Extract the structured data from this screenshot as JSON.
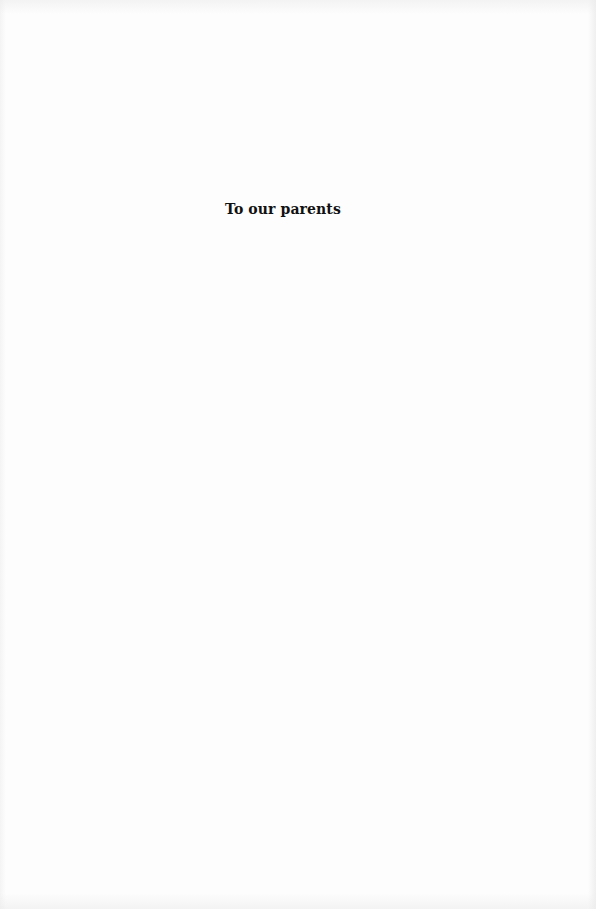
{
  "page": {
    "type": "dedication",
    "dedication_text": "To our parents",
    "colors": {
      "background": "#fdfdfd",
      "text": "#111111"
    }
  }
}
